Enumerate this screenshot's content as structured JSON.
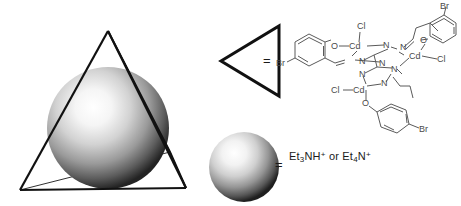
{
  "figure": {
    "background_color": "#ffffff",
    "line_color": "#1a1a1a",
    "structure_line_color": "#555555"
  },
  "cage": {
    "name": "tetrahedron-with-encapsulated-sphere",
    "description": "Wireframe tetrahedron enclosing a shaded grey sphere",
    "vertex_count": 4,
    "sphere_fill_light": "#ffffff",
    "sphere_fill_dark": "#2a2a2a"
  },
  "legend": {
    "equals": "=",
    "rows": [
      {
        "symbol": "triangle",
        "symbol_name": "triangle-glyph",
        "equals": "=",
        "definition": "trinuclear cadmium complex"
      },
      {
        "symbol": "sphere",
        "symbol_name": "sphere-glyph",
        "equals": "=",
        "definition_parts": [
          "Et",
          "3",
          "NH",
          "+",
          " or ",
          "Et",
          "4",
          "N",
          "+"
        ],
        "definition_plain": "Et3NH+ or Et4N+"
      }
    ]
  },
  "structure": {
    "name": "trinuclear-cd-hydrazone-complex",
    "atom_labels": [
      {
        "id": "cl-top",
        "text": "Cl",
        "x": 86,
        "y": 24
      },
      {
        "id": "o-left",
        "text": "O",
        "x": 59,
        "y": 44
      },
      {
        "id": "cd-left",
        "text": "Cd",
        "x": 84,
        "y": 44
      },
      {
        "id": "n-a",
        "text": "N",
        "x": 115,
        "y": 42
      },
      {
        "id": "n-b",
        "text": "N",
        "x": 111,
        "y": 62
      },
      {
        "id": "n-c",
        "text": "N",
        "x": 77,
        "y": 58
      },
      {
        "id": "n-d",
        "text": "N",
        "x": 86,
        "y": 72
      },
      {
        "id": "n-e",
        "text": "N",
        "x": 123,
        "y": 65
      },
      {
        "id": "n-f",
        "text": "N",
        "x": 116,
        "y": 82
      },
      {
        "id": "n-g",
        "text": "N",
        "x": 128,
        "y": 46
      },
      {
        "id": "cd-right",
        "text": "Cd",
        "x": 140,
        "y": 54
      },
      {
        "id": "cl-right",
        "text": "Cl",
        "x": 168,
        "y": 58
      },
      {
        "id": "o-right",
        "text": "O",
        "x": 152,
        "y": 36
      },
      {
        "id": "br-top",
        "text": "Br",
        "x": 166,
        "y": 6
      },
      {
        "id": "cl-bottom",
        "text": "Cl",
        "x": 60,
        "y": 86
      },
      {
        "id": "cd-bottom",
        "text": "Cd",
        "x": 86,
        "y": 86
      },
      {
        "id": "o-bottom",
        "text": "O",
        "x": 88,
        "y": 102
      },
      {
        "id": "br-bottom",
        "text": "Br",
        "x": 162,
        "y": 124
      },
      {
        "id": "br-left",
        "text": "Br",
        "x": 5,
        "y": 60
      }
    ],
    "metal_count": 3,
    "metal": "Cd",
    "halide": "Cl",
    "substituent": "Br"
  }
}
